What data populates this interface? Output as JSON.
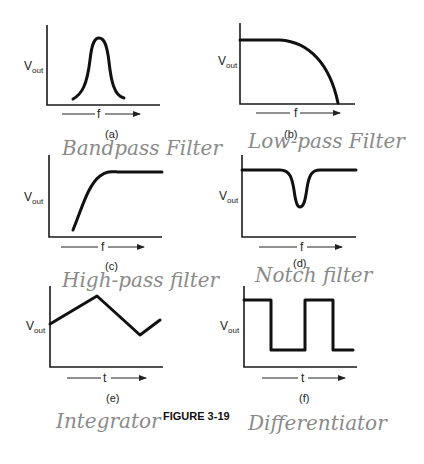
{
  "figure_label": "FIGURE 3-19",
  "panels": [
    {
      "id": "a",
      "caption": "(a)",
      "ylabel": "V",
      "ysub": "out",
      "xlabel": "f",
      "annotation": "Bandpass Filter",
      "shape": "bandpass"
    },
    {
      "id": "b",
      "caption": "(b)",
      "ylabel": "V",
      "ysub": "out",
      "xlabel": "f",
      "annotation": "Low-pass Filter",
      "shape": "lowpass"
    },
    {
      "id": "c",
      "caption": "(c)",
      "ylabel": "V",
      "ysub": "out",
      "xlabel": "f",
      "annotation": "High-pass filter",
      "shape": "highpass"
    },
    {
      "id": "d",
      "caption": "(d)",
      "ylabel": "V",
      "ysub": "out",
      "xlabel": "f",
      "annotation": "Notch filter",
      "shape": "notch"
    },
    {
      "id": "e",
      "caption": "(e)",
      "ylabel": "V",
      "ysub": "out",
      "xlabel": "t",
      "annotation": "Integrator",
      "shape": "triangle"
    },
    {
      "id": "f",
      "caption": "(f)",
      "ylabel": "V",
      "ysub": "out",
      "xlabel": "t",
      "annotation": "Differentiator",
      "shape": "square"
    }
  ]
}
